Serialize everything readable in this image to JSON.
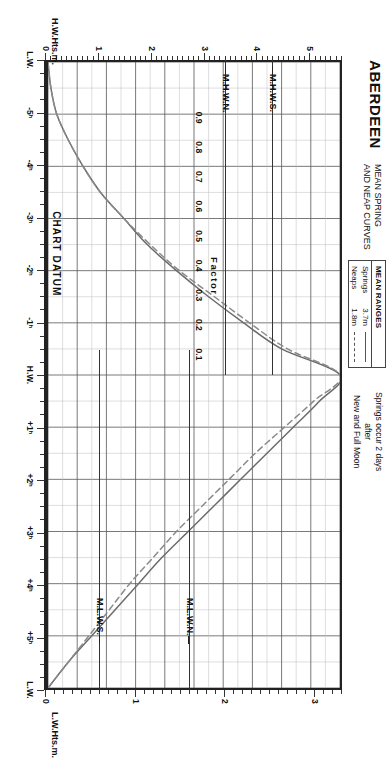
{
  "title": "ABERDEEN",
  "subtitle_line1": "MEAN SPRING",
  "subtitle_line2": "AND NEAP CURVES",
  "legend": {
    "heading": "MEAN RANGES",
    "rows": [
      {
        "name": "Springs",
        "value": "3.7m",
        "style": "solid"
      },
      {
        "name": "Neaps",
        "value": "1.8m",
        "style": "dashed"
      }
    ]
  },
  "note": {
    "line1": "Springs occur 2 days",
    "line2": "after",
    "line3": "New and Full Moon"
  },
  "axes": {
    "time_axis_title": "",
    "left_axis_title": "H.W.Hts.m.",
    "right_axis_title": "L.W.Hts.m.",
    "factor_label": "Factor",
    "chart_datum_label": "CHART DATUM",
    "time_labels": [
      "-5ʰ",
      "-4ʰ",
      "-3ʰ",
      "-2ʰ",
      "-1ʰ",
      "H.W.",
      "+1ʰ",
      "+2ʰ",
      "+3ʰ",
      "+4ʰ",
      "+5ʰ",
      "L.W."
    ],
    "factor_values": [
      "0.9",
      "0.8",
      "0.7",
      "0.6",
      "0.5",
      "0.4",
      "0.3",
      "0.2",
      "0.1"
    ],
    "left_height_labels": [
      "0",
      "1",
      "2",
      "3",
      "4",
      "5"
    ],
    "right_height_labels": [
      "0",
      "1",
      "2",
      "3"
    ]
  },
  "levels": [
    {
      "label": "M.H.W.S.",
      "side": "left",
      "height_m": 4.3
    },
    {
      "label": "M.H.W.N.",
      "side": "left",
      "height_m": 3.4
    },
    {
      "label": "M.L.W.N.",
      "side": "right",
      "height_m": 1.6
    },
    {
      "label": "M.L.W.S.",
      "side": "right",
      "height_m": 0.6
    }
  ],
  "colors": {
    "frame": "#222222",
    "grid_major": "#555555",
    "grid_minor": "#bbbbbb",
    "curve_spring": "#6b6b6b",
    "curve_neap": "#8a8a8a",
    "text": "#111111",
    "background": "#ffffff"
  },
  "chart_data": {
    "type": "line",
    "xlabel": "Hours relative to High Water",
    "ylabel": "Tidal Factor",
    "xlim": [
      -6,
      6
    ],
    "ylim": [
      0,
      1
    ],
    "grid": true,
    "legend_position": "top-left",
    "mean_range_springs_m": 3.7,
    "mean_range_neaps_m": 1.8,
    "left_axis": {
      "name": "H.W.Hts.m.",
      "min": 0,
      "max": 5.6,
      "ticks": [
        0,
        1,
        2,
        3,
        4,
        5
      ]
    },
    "right_axis": {
      "name": "L.W.Hts.m.",
      "min": 0,
      "max": 3.3,
      "ticks": [
        0,
        1,
        2,
        3
      ]
    },
    "x": [
      -6.0,
      -5.5,
      -5.0,
      -4.5,
      -4.0,
      -3.5,
      -3.0,
      -2.5,
      -2.0,
      -1.5,
      -1.0,
      -0.5,
      0.0,
      0.5,
      1.0,
      1.5,
      2.0,
      2.5,
      3.0,
      3.5,
      4.0,
      4.5,
      5.0,
      5.5,
      6.0
    ],
    "series": [
      {
        "name": "Springs",
        "style": "solid",
        "values": [
          0.0,
          0.01,
          0.03,
          0.07,
          0.12,
          0.18,
          0.26,
          0.34,
          0.44,
          0.55,
          0.67,
          0.8,
          1.0,
          0.93,
          0.84,
          0.75,
          0.66,
          0.57,
          0.48,
          0.39,
          0.31,
          0.23,
          0.15,
          0.07,
          0.0
        ]
      },
      {
        "name": "Neaps",
        "style": "dashed",
        "values": [
          0.0,
          0.01,
          0.03,
          0.07,
          0.12,
          0.18,
          0.26,
          0.35,
          0.45,
          0.57,
          0.69,
          0.82,
          1.0,
          0.91,
          0.81,
          0.71,
          0.62,
          0.53,
          0.44,
          0.36,
          0.28,
          0.21,
          0.14,
          0.07,
          0.0
        ]
      }
    ],
    "annotations": [
      {
        "text": "M.H.W.S.",
        "value_m": 4.3,
        "axis": "left"
      },
      {
        "text": "M.H.W.N.",
        "value_m": 3.4,
        "axis": "left"
      },
      {
        "text": "M.L.W.N.",
        "value_m": 1.6,
        "axis": "right"
      },
      {
        "text": "M.L.W.S.",
        "value_m": 0.6,
        "axis": "right"
      },
      {
        "text": "CHART DATUM",
        "value_m": 0.0,
        "axis": "both"
      }
    ]
  }
}
